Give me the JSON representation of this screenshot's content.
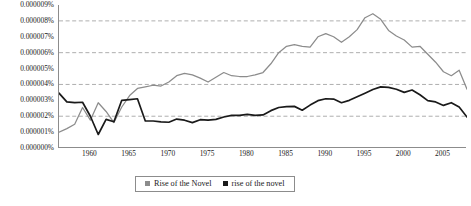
{
  "chart_data": {
    "type": "line",
    "title": "",
    "xlabel": "",
    "ylabel": "",
    "xlim": [
      1956,
      2008
    ],
    "ylim": [
      0,
      9e-06
    ],
    "grid": "horizontal-dashed-at-even-ticks",
    "legend_position": "bottom-center",
    "y_tick_labels": [
      "0.000009%",
      "0.000008%",
      "0.000007%",
      "0.000006%",
      "0.000005%",
      "0.000004%",
      "0.000003%",
      "0.000002%",
      "0.000001%",
      "0.000000%"
    ],
    "y_tick_values": [
      9e-06,
      8e-06,
      7e-06,
      6e-06,
      5e-06,
      4e-06,
      3e-06,
      2e-06,
      1e-06,
      0
    ],
    "gridline_values": [
      8e-06,
      6e-06,
      4e-06,
      2e-06
    ],
    "x_tick_labels": [
      "1960",
      "1965",
      "1970",
      "1975",
      "1980",
      "1985",
      "1990",
      "1995",
      "2000",
      "2005"
    ],
    "x_tick_values": [
      1960,
      1965,
      1970,
      1975,
      1980,
      1985,
      1990,
      1995,
      2000,
      2005
    ],
    "x": [
      1956,
      1957,
      1958,
      1959,
      1960,
      1961,
      1962,
      1963,
      1964,
      1965,
      1966,
      1967,
      1968,
      1969,
      1970,
      1971,
      1972,
      1973,
      1974,
      1975,
      1976,
      1977,
      1978,
      1979,
      1980,
      1981,
      1982,
      1983,
      1984,
      1985,
      1986,
      1987,
      1988,
      1989,
      1990,
      1991,
      1992,
      1993,
      1994,
      1995,
      1996,
      1997,
      1998,
      1999,
      2000,
      2001,
      2002,
      2003,
      2004,
      2005,
      2006,
      2007,
      2008
    ],
    "series": [
      {
        "name": "Rise of the Novel",
        "color": "#8c8c8c",
        "values": [
          1e-06,
          1.22e-06,
          1.5e-06,
          2.55e-06,
          1.75e-06,
          2.85e-06,
          2.3e-06,
          1.6e-06,
          2.58e-06,
          3.3e-06,
          3.75e-06,
          3.85e-06,
          3.95e-06,
          3.9e-06,
          4.15e-06,
          4.55e-06,
          4.7e-06,
          4.6e-06,
          4.4e-06,
          4.15e-06,
          4.45e-06,
          4.75e-06,
          4.55e-06,
          4.5e-06,
          4.5e-06,
          4.6e-06,
          4.75e-06,
          5.3e-06,
          6e-06,
          6.4e-06,
          6.5e-06,
          6.4e-06,
          6.35e-06,
          7e-06,
          7.2e-06,
          7e-06,
          6.65e-06,
          7e-06,
          7.45e-06,
          8.2e-06,
          8.45e-06,
          8.1e-06,
          7.4e-06,
          7.05e-06,
          6.8e-06,
          6.35e-06,
          6.4e-06,
          5.9e-06,
          5.4e-06,
          4.8e-06,
          4.55e-06,
          4.9e-06,
          3.7e-06
        ]
      },
      {
        "name": "rise of the novel",
        "color": "#1a1a1a",
        "values": [
          3.45e-06,
          2.9e-06,
          2.85e-06,
          2.88e-06,
          2e-06,
          8.5e-07,
          1.8e-06,
          1.65e-06,
          3e-06,
          3.05e-06,
          3.1e-06,
          1.7e-06,
          1.7e-06,
          1.65e-06,
          1.62e-06,
          1.82e-06,
          1.75e-06,
          1.6e-06,
          1.78e-06,
          1.75e-06,
          1.8e-06,
          1.95e-06,
          2.05e-06,
          2.05e-06,
          2.12e-06,
          2.05e-06,
          2.08e-06,
          2.35e-06,
          2.55e-06,
          2.6e-06,
          2.62e-06,
          2.38e-06,
          2.7e-06,
          2.98e-06,
          3.1e-06,
          3.08e-06,
          2.85e-06,
          3e-06,
          3.22e-06,
          3.45e-06,
          3.68e-06,
          3.85e-06,
          3.82e-06,
          3.7e-06,
          3.5e-06,
          3.65e-06,
          3.35e-06,
          2.98e-06,
          2.9e-06,
          2.68e-06,
          2.85e-06,
          2.58e-06,
          1.95e-06
        ]
      }
    ]
  },
  "legend": {
    "entries": [
      {
        "label": "Rise of the Novel",
        "color": "#8c8c8c"
      },
      {
        "label": "rise of the novel",
        "color": "#1a1a1a"
      }
    ]
  }
}
